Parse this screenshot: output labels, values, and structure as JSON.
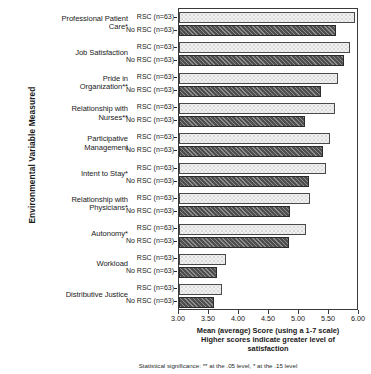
{
  "chart_data": {
    "type": "bar",
    "orientation": "horizontal",
    "title": "",
    "xlabel": "Mean (average) Score (using a 1-7 scale) Higher scores indicate greater level of satisfaction",
    "ylabel": "Environmental Variable Measured",
    "xlim": [
      3.0,
      6.0
    ],
    "xticks": [
      "3.00",
      "3.50",
      "4.00",
      "4.50",
      "5.00",
      "5.50",
      "6.00"
    ],
    "xtick_values": [
      3.0,
      3.5,
      4.0,
      4.5,
      5.0,
      5.5,
      6.0
    ],
    "grid": false,
    "legend": "none",
    "categories": [
      "Professional Patient Care*",
      "Job Satisfaction",
      "Pride in Organization**",
      "Relationship with Nurses**",
      "Participative Management",
      "Intent to Stay*",
      "Relationship with Physicians*",
      "Autonomy*",
      "Workload",
      "Distributive Justice"
    ],
    "category_lines": [
      [
        "Professional Patient",
        "Care*"
      ],
      [
        "Job Satisfaction"
      ],
      [
        "Pride in",
        "Organization**"
      ],
      [
        "Relationship with",
        "Nurses**"
      ],
      [
        "Participative",
        "Management"
      ],
      [
        "Intent to Stay*"
      ],
      [
        "Relationship with",
        "Physicians*"
      ],
      [
        "Autonomy*"
      ],
      [
        "Workload"
      ],
      [
        "Distributive Justice"
      ]
    ],
    "series": [
      {
        "name": "RSC (n=63)",
        "values": [
          5.93,
          5.85,
          5.65,
          5.6,
          5.52,
          5.45,
          5.18,
          5.12,
          3.78,
          3.72
        ]
      },
      {
        "name": "No RSC (n=63)",
        "values": [
          5.62,
          5.75,
          5.37,
          5.1,
          5.4,
          5.17,
          4.85,
          4.83,
          3.63,
          3.58
        ]
      }
    ],
    "footnote": "Statistical significance:  ** at the .05 level,  * at the .15 level"
  },
  "axis_caption": {
    "line1": "Mean (average) Score (using a 1-7 scale)",
    "line2": "Higher scores indicate greater level of",
    "line3": "satisfaction"
  }
}
